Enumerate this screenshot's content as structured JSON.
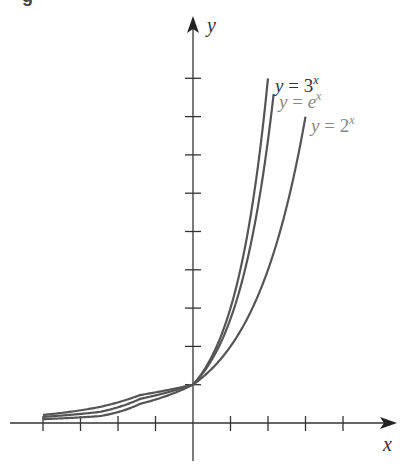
{
  "figure": {
    "caption_fragment": "g"
  },
  "chart_data": {
    "type": "line",
    "title": "",
    "xlabel": "x",
    "ylabel": "y",
    "grid": false,
    "legend": "inline labels near curve ends",
    "xlim": [
      -5,
      5.5
    ],
    "ylim": [
      -1,
      10.5
    ],
    "x_ticks": [
      -4,
      -3,
      -2,
      -1,
      1,
      2,
      3,
      4
    ],
    "y_ticks": [
      1,
      2,
      3,
      4,
      5,
      6,
      7,
      8,
      9
    ],
    "tick_labels_shown": false,
    "intersection_point": [
      0,
      1
    ],
    "series": [
      {
        "name": "y = 3^x",
        "label_main": "y = 3",
        "label_exp": "x",
        "base": 3,
        "x_range": [
          -4,
          2
        ],
        "drawn_negative_side": [
          [
            -4,
            0.1
          ],
          [
            -2.48,
            0.18
          ],
          [
            -1.41,
            0.5
          ],
          [
            0,
            1
          ]
        ],
        "label_color": "#333333"
      },
      {
        "name": "y = e^x",
        "label_main": "y = e",
        "label_exp": "x",
        "base": 2.718281828,
        "x_range": [
          -4,
          2.15
        ],
        "drawn_negative_side": [
          [
            -4,
            0.16
          ],
          [
            -2.48,
            0.29
          ],
          [
            -1.41,
            0.63
          ],
          [
            0,
            1
          ]
        ],
        "label_color": "#777777"
      },
      {
        "name": "y = 2^x",
        "label_main": "y = 2",
        "label_exp": "x",
        "base": 2,
        "x_range": [
          -4,
          3
        ],
        "drawn_negative_side": [
          [
            -4,
            0.21
          ],
          [
            -2.48,
            0.42
          ],
          [
            -1.41,
            0.73
          ],
          [
            0,
            1
          ]
        ],
        "label_color": "#777777"
      }
    ]
  },
  "style": {
    "axis_color": "#333333",
    "curve_color": "#555555"
  }
}
